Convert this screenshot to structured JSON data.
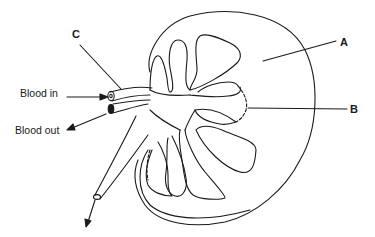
{
  "diagram": {
    "labels": {
      "a": "A",
      "b": "B",
      "c": "C",
      "blood_in": "Blood in",
      "blood_out": "Blood out"
    },
    "colors": {
      "line": "#1a1a1a",
      "background": "#ffffff"
    }
  }
}
